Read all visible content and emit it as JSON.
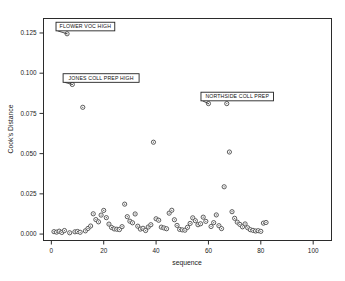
{
  "clipped_title": "Cook's Distance",
  "chart_data": {
    "type": "scatter",
    "title": "Cook's Distance",
    "xlabel": "sequence",
    "ylabel": "Cook's Distance",
    "xlim": [
      -3,
      107
    ],
    "ylim": [
      -0.004,
      0.134
    ],
    "xticks": [
      0,
      20,
      40,
      60,
      80,
      100
    ],
    "xtick_labels": [
      "0",
      "20",
      "40",
      "60",
      "80",
      "100"
    ],
    "yticks": [
      0.0,
      0.025,
      0.05,
      0.075,
      0.1,
      0.125
    ],
    "ytick_labels": [
      "0.000",
      "0.025",
      "0.050",
      "0.075",
      "0.100",
      "0.125"
    ],
    "grid": false,
    "legend": false,
    "marker": "open-circle",
    "points": [
      {
        "x": 1,
        "y": 0.0015
      },
      {
        "x": 2,
        "y": 0.0012
      },
      {
        "x": 3,
        "y": 0.0018
      },
      {
        "x": 4,
        "y": 0.001
      },
      {
        "x": 5,
        "y": 0.0022
      },
      {
        "x": 6,
        "y": 0.1245
      },
      {
        "x": 7,
        "y": 0.0008
      },
      {
        "x": 8,
        "y": 0.093
      },
      {
        "x": 9,
        "y": 0.0014
      },
      {
        "x": 10,
        "y": 0.0016
      },
      {
        "x": 11,
        "y": 0.0011
      },
      {
        "x": 12,
        "y": 0.0788
      },
      {
        "x": 13,
        "y": 0.002
      },
      {
        "x": 14,
        "y": 0.0035
      },
      {
        "x": 15,
        "y": 0.005
      },
      {
        "x": 16,
        "y": 0.0126
      },
      {
        "x": 17,
        "y": 0.009
      },
      {
        "x": 18,
        "y": 0.0076
      },
      {
        "x": 19,
        "y": 0.0118
      },
      {
        "x": 20,
        "y": 0.0147
      },
      {
        "x": 21,
        "y": 0.0102
      },
      {
        "x": 22,
        "y": 0.0062
      },
      {
        "x": 23,
        "y": 0.0041
      },
      {
        "x": 24,
        "y": 0.0032
      },
      {
        "x": 25,
        "y": 0.003
      },
      {
        "x": 26,
        "y": 0.0028
      },
      {
        "x": 27,
        "y": 0.0046
      },
      {
        "x": 28,
        "y": 0.0186
      },
      {
        "x": 29,
        "y": 0.0108
      },
      {
        "x": 30,
        "y": 0.008
      },
      {
        "x": 31,
        "y": 0.007
      },
      {
        "x": 32,
        "y": 0.0125
      },
      {
        "x": 33,
        "y": 0.0049
      },
      {
        "x": 34,
        "y": 0.0031
      },
      {
        "x": 35,
        "y": 0.0036
      },
      {
        "x": 36,
        "y": 0.0022
      },
      {
        "x": 37,
        "y": 0.0044
      },
      {
        "x": 38,
        "y": 0.0058
      },
      {
        "x": 39,
        "y": 0.0571
      },
      {
        "x": 40,
        "y": 0.0095
      },
      {
        "x": 41,
        "y": 0.0086
      },
      {
        "x": 42,
        "y": 0.0043
      },
      {
        "x": 43,
        "y": 0.0038
      },
      {
        "x": 44,
        "y": 0.0033
      },
      {
        "x": 45,
        "y": 0.013
      },
      {
        "x": 46,
        "y": 0.0148
      },
      {
        "x": 47,
        "y": 0.0089
      },
      {
        "x": 48,
        "y": 0.0054
      },
      {
        "x": 49,
        "y": 0.0029
      },
      {
        "x": 50,
        "y": 0.0026
      },
      {
        "x": 51,
        "y": 0.0024
      },
      {
        "x": 52,
        "y": 0.0042
      },
      {
        "x": 53,
        "y": 0.0066
      },
      {
        "x": 54,
        "y": 0.0101
      },
      {
        "x": 55,
        "y": 0.0083
      },
      {
        "x": 56,
        "y": 0.0058
      },
      {
        "x": 57,
        "y": 0.0064
      },
      {
        "x": 58,
        "y": 0.0105
      },
      {
        "x": 59,
        "y": 0.0079
      },
      {
        "x": 60,
        "y": 0.0811
      },
      {
        "x": 61,
        "y": 0.0047
      },
      {
        "x": 62,
        "y": 0.0071
      },
      {
        "x": 63,
        "y": 0.0119
      },
      {
        "x": 64,
        "y": 0.0052
      },
      {
        "x": 65,
        "y": 0.0034
      },
      {
        "x": 66,
        "y": 0.0294
      },
      {
        "x": 67,
        "y": 0.0811
      },
      {
        "x": 68,
        "y": 0.051
      },
      {
        "x": 69,
        "y": 0.0139
      },
      {
        "x": 70,
        "y": 0.0098
      },
      {
        "x": 71,
        "y": 0.0074
      },
      {
        "x": 72,
        "y": 0.006
      },
      {
        "x": 73,
        "y": 0.0045
      },
      {
        "x": 74,
        "y": 0.0063
      },
      {
        "x": 75,
        "y": 0.0039
      },
      {
        "x": 76,
        "y": 0.0027
      },
      {
        "x": 77,
        "y": 0.0023
      },
      {
        "x": 78,
        "y": 0.0019
      },
      {
        "x": 79,
        "y": 0.0021
      },
      {
        "x": 80,
        "y": 0.0017
      },
      {
        "x": 81,
        "y": 0.0068
      },
      {
        "x": 82,
        "y": 0.0072
      }
    ],
    "annotations": [
      {
        "label": "FLOWER VOC HIGH",
        "x": 6,
        "y": 0.1245,
        "box_x": 13,
        "box_y": 0.129
      },
      {
        "label": "JONES COLL PREP HIGH",
        "x": 8,
        "y": 0.093,
        "box_x": 19,
        "box_y": 0.097
      },
      {
        "label": "NORTHSIDE COLL PREP",
        "x": 60,
        "y": 0.0811,
        "box_x": 71,
        "box_y": 0.0855
      }
    ]
  }
}
